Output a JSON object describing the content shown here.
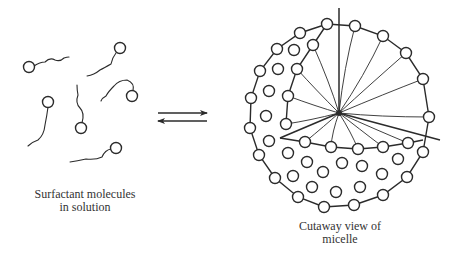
{
  "diagram": {
    "stroke_color": "#2b2b2b",
    "background": "#ffffff",
    "left_panel": {
      "caption_line1": "Surfactant molecules",
      "caption_line2": "in solution",
      "molecules": [
        {
          "head": [
            29,
            67
          ],
          "tail": "M34 66 Q40 62 45 62 Q50 57 55 60 Q60 62 64 58 Q67 57 69 57"
        },
        {
          "head": [
            120,
            48
          ],
          "tail": "M116 53 Q112 58 111 64 Q104 68 100 70 Q94 75 87 76"
        },
        {
          "head": [
            132,
            96
          ],
          "tail": "M133 91 Q135 83 127 80 Q119 80 114 86 Q108 92 106 96 Q102 98 101 101"
        },
        {
          "head": [
            48,
            102
          ],
          "tail": "M48 107 Q47 115 45 125 Q44 135 38 140 Q32 142 28 146"
        },
        {
          "head": [
            81,
            128
          ],
          "tail": "M82 123 Q85 113 80 108 Q75 103 78 95 Q77 90 77 85"
        },
        {
          "head": [
            116,
            148
          ],
          "tail": "M111 149 Q105 150 102 157 Q96 160 86 159 Q77 161 70 162"
        }
      ],
      "head_radius": 5.5
    },
    "equilibrium_arrows": {
      "forward": {
        "from": [
          158,
          113
        ],
        "to": [
          207,
          113
        ]
      },
      "reverse": {
        "from": [
          207,
          121
        ],
        "to": [
          158,
          121
        ]
      }
    },
    "right_panel": {
      "caption_line1": "Cutaway view of",
      "caption_line2": "micelle",
      "center": [
        339,
        113
      ],
      "head_radius": 5.5,
      "outer_ring": [
        [
          327,
          24
        ],
        [
          355,
          26
        ],
        [
          383,
          36
        ],
        [
          406,
          53
        ],
        [
          423,
          79
        ],
        [
          429,
          117
        ],
        [
          423,
          152
        ],
        [
          407,
          177
        ],
        [
          383,
          195
        ],
        [
          354,
          205
        ],
        [
          324,
          207
        ],
        [
          298,
          197
        ],
        [
          275,
          178
        ],
        [
          259,
          155
        ],
        [
          250,
          128
        ],
        [
          251,
          98
        ],
        [
          260,
          71
        ],
        [
          277,
          49
        ],
        [
          300,
          33
        ]
      ],
      "cut_arc_heads": [
        [
          313,
          45
        ],
        [
          297,
          69
        ],
        [
          288,
          96
        ],
        [
          286,
          124
        ]
      ],
      "equator_heads": [
        [
          305,
          142
        ],
        [
          331,
          147
        ],
        [
          358,
          149
        ],
        [
          383,
          147
        ],
        [
          408,
          143
        ]
      ],
      "interior_heads": [
        [
          294,
          50
        ],
        [
          278,
          69
        ],
        [
          269,
          91
        ],
        [
          266,
          116
        ],
        [
          269,
          141
        ],
        [
          288,
          153
        ],
        [
          307,
          162
        ],
        [
          342,
          163
        ],
        [
          362,
          166
        ],
        [
          398,
          159
        ],
        [
          293,
          176
        ],
        [
          323,
          172
        ],
        [
          382,
          174
        ],
        [
          312,
          187
        ],
        [
          336,
          192
        ],
        [
          360,
          187
        ]
      ],
      "tail_targets": [
        [
          355,
          26
        ],
        [
          383,
          36
        ],
        [
          406,
          53
        ],
        [
          423,
          79
        ],
        [
          429,
          117
        ],
        [
          313,
          45
        ],
        [
          297,
          69
        ],
        [
          288,
          96
        ],
        [
          286,
          124
        ],
        [
          305,
          142
        ],
        [
          331,
          147
        ],
        [
          358,
          149
        ],
        [
          383,
          147
        ],
        [
          408,
          143
        ]
      ],
      "cut_lines": [
        {
          "from": [
            339,
            8
          ],
          "to": [
            339,
            113
          ]
        },
        {
          "from": [
            339,
            113
          ],
          "to": [
            440,
            140
          ]
        },
        {
          "from": [
            339,
            113
          ],
          "to": [
            280,
            138
          ]
        }
      ]
    }
  }
}
